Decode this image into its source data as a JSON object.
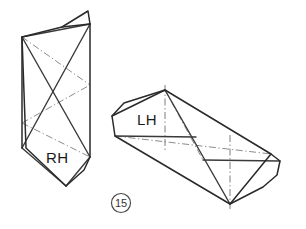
{
  "figure": {
    "number_label": "15",
    "background_color": "#ffffff",
    "line_color": "#2a2a2a",
    "hidden_line_color": "#8c8c8c",
    "width": 306,
    "height": 229
  },
  "solids": [
    {
      "id": "left-solid",
      "hand_label": "RH",
      "description": "right-hand tapered prism shown in upright orientation",
      "label_position": {
        "x": 46,
        "y": 163
      },
      "outline_points": "62,27 88,11 89,24 90,157 84,170 66,186 26,148 22,37",
      "front_face_points": "62,27 90,24 90,157 66,186 22,148 22,37",
      "edges": [
        "62,27 22,37",
        "62,27 88,11",
        "88,11 90,24",
        "90,24 90,157",
        "90,157 84,170",
        "84,170 66,186",
        "66,186 26,148",
        "26,148 22,37",
        "22,37 22,148",
        "22,148 26,148",
        "22,37 62,27"
      ],
      "construction_lines": [
        "22,37 90,24",
        "22,37 90,157",
        "90,24 22,148",
        "22,148 66,186",
        "66,186 90,157"
      ],
      "hidden_lines": [
        "22,37 90,85",
        "22,123 90,85",
        "22,123 90,157"
      ]
    },
    {
      "id": "right-solid",
      "hand_label": "LH",
      "description": "left-hand tapered prism shown reclined",
      "label_position": {
        "x": 137,
        "y": 125
      },
      "outline_points": "165,90 271,154 280,161 277,175 263,187 230,204 115,136 112,116 124,103",
      "edges": [
        "165,90 112,116",
        "112,116 124,103",
        "124,103 165,90",
        "112,116 115,136",
        "115,136 230,204",
        "230,204 263,187",
        "263,187 277,175",
        "277,175 280,161",
        "280,161 271,154",
        "271,154 165,90",
        "165,90 230,204",
        "271,154 230,204"
      ],
      "construction_lines": [
        "115,136 196,137",
        "196,137 271,154",
        "203,160 280,161",
        "165,90 230,204"
      ],
      "hidden_lines": [
        "115,136 271,154",
        "165,90 203,160"
      ],
      "center_lines": [
        "165,85 165,152",
        "230,135 230,209"
      ]
    }
  ]
}
